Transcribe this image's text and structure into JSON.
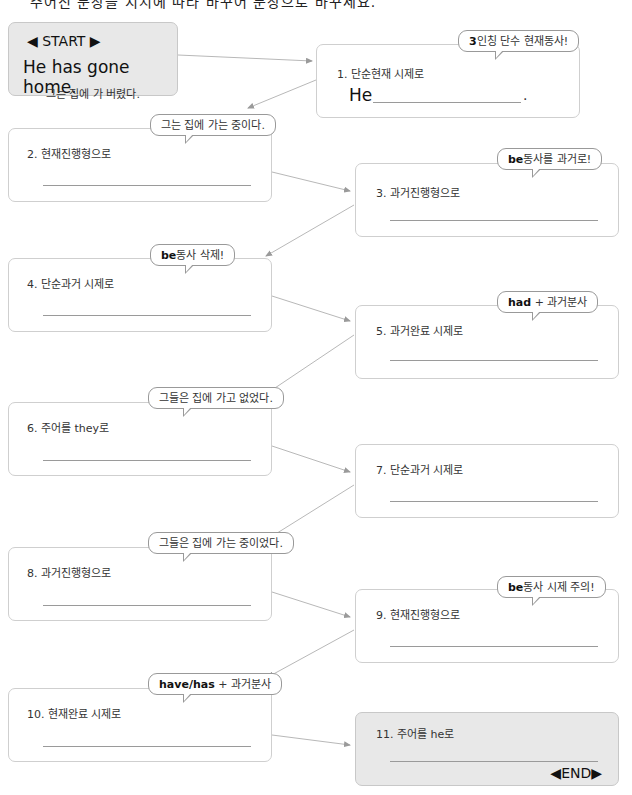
{
  "header": {
    "instruction": "주어진 문장을 지시에 따라 바꾸어 문장으로 바꾸세요."
  },
  "start": {
    "title": "◀ START ▶",
    "sentence": "He has gone home.",
    "translation": "그는 집에 가 버렸다."
  },
  "steps": [
    {
      "number": 1,
      "label": "1. 단순현재 시제로",
      "prefix": "He",
      "suffix": ".",
      "hint_bold": "3",
      "hint_text": "인칭 단수 현재동사!"
    },
    {
      "number": 2,
      "label": "2. 현재진행형으로",
      "hint_bold": "",
      "hint_text": "그는 집에 가는 중이다."
    },
    {
      "number": 3,
      "label": "3. 과거진행형으로",
      "hint_bold": "be",
      "hint_text": "동사를 과거로!"
    },
    {
      "number": 4,
      "label": "4. 단순과거 시제로",
      "hint_bold": "be",
      "hint_text": "동사 삭제!"
    },
    {
      "number": 5,
      "label": "5. 과거완료 시제로",
      "hint_bold": "had",
      "hint_text": " + 과거분사"
    },
    {
      "number": 6,
      "label": "6. 주어를 they로",
      "hint_bold": "",
      "hint_text": "그들은 집에 가고 없었다."
    },
    {
      "number": 7,
      "label": "7. 단순과거 시제로",
      "hint_bold": "",
      "hint_text": ""
    },
    {
      "number": 8,
      "label": "8. 과거진행형으로",
      "hint_bold": "",
      "hint_text": "그들은 집에 가는 중이었다."
    },
    {
      "number": 9,
      "label": "9. 현재진행형으로",
      "hint_bold": "be",
      "hint_text": "동사 시제 주의!"
    },
    {
      "number": 10,
      "label": "10. 현재완료 시제로",
      "hint_bold": "have/has",
      "hint_text": " + 과거분사"
    },
    {
      "number": 11,
      "label": "11. 주어를 he로",
      "hint_bold": "",
      "hint_text": ""
    }
  ],
  "end": {
    "label": "◀END▶"
  },
  "colors": {
    "box_border": "#cfcfcf",
    "gray_box": "#e8e8e8",
    "connector": "#b8b8b8",
    "answer_line": "#9a9a9a"
  }
}
